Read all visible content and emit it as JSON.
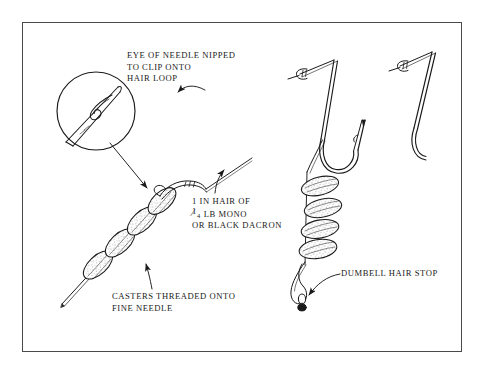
{
  "plate": {
    "title": "Hair rig with casters threaded on a fine needle",
    "background_color": "#ffffff",
    "ink_color": "#1a1a1a",
    "frame_color": "#4a4a4a"
  },
  "captions": {
    "eye_of_needle": {
      "name": "eye-of-needle-caption",
      "lines": [
        "EYE OF NEEDLE NIPPED",
        "TO CLIP ONTO",
        "HAIR LOOP"
      ]
    },
    "hair_material": {
      "name": "hair-material-caption",
      "lines": [
        "1  IN HAIR OF",
        "LB MONO",
        "OR BLACK DACRON"
      ],
      "line1": "1  IN HAIR OF",
      "fraction_numerator": "1",
      "fraction_denominator": "4",
      "line2_rest": "LB MONO",
      "line3": "OR BLACK DACRON"
    },
    "casters_threaded": {
      "name": "casters-threaded-caption",
      "lines": [
        "CASTERS THREADED ONTO",
        "FINE NEEDLE"
      ]
    },
    "dumbell_stop": {
      "name": "dumbell-hair-stop-caption",
      "lines": [
        "DUMBELL HAIR STOP"
      ]
    }
  },
  "figure_elements": {
    "inset_circle": "magnified-needle-eye-detail",
    "needle": "fine-sewing-needle",
    "left_caster_count": 4,
    "right_caster_count": 4,
    "hooks": 2,
    "knots": 2,
    "hair_loop": "loop-knot-on-hair",
    "dumbell_stop": "dumbell-shaped-hair-stop"
  }
}
